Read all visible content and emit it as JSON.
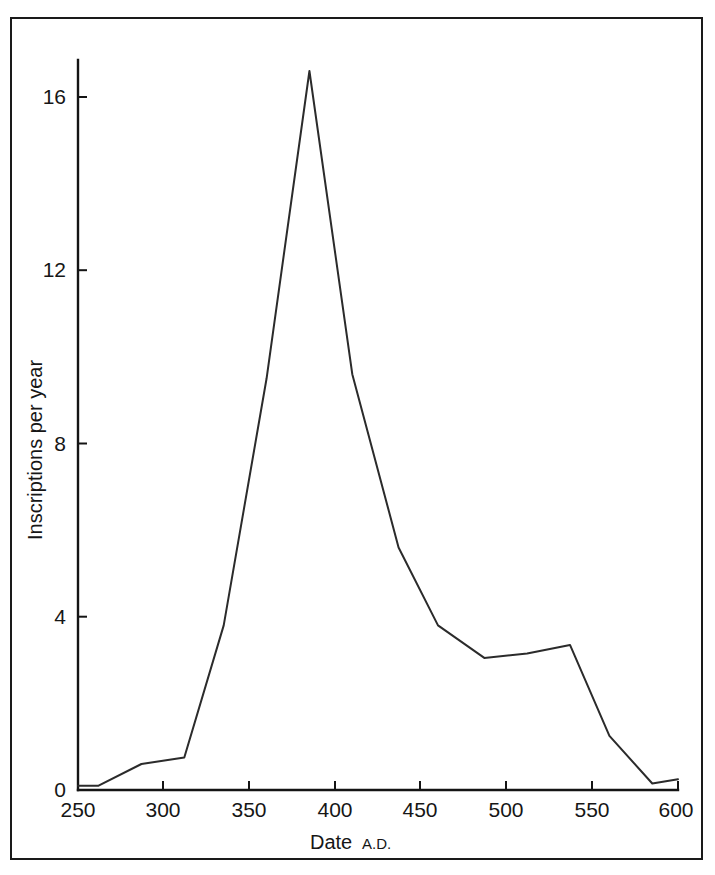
{
  "figure": {
    "background_color": "#ffffff",
    "frame_color": "#1a1a1a",
    "line_color": "#2b2b2b"
  },
  "axes": {
    "x_title_main": "Date",
    "x_title_suffix": "A.D.",
    "y_title": "Inscriptions per year",
    "x_tick_labels": [
      "250",
      "300",
      "350",
      "400",
      "450",
      "500",
      "550",
      "600"
    ],
    "y_tick_labels": [
      "0",
      "4",
      "8",
      "12",
      "16"
    ]
  },
  "chart_data": {
    "type": "line",
    "title": "",
    "xlabel": "Date A.D.",
    "ylabel": "Inscriptions per year",
    "xlim": [
      250,
      600
    ],
    "ylim": [
      0,
      17.4
    ],
    "xticks": [
      250,
      300,
      350,
      400,
      450,
      500,
      550,
      600
    ],
    "yticks": [
      0,
      4,
      8,
      12,
      16
    ],
    "grid": false,
    "legend": false,
    "x": [
      250,
      262,
      287,
      312,
      335,
      360,
      385,
      410,
      437,
      460,
      487,
      512,
      537,
      560,
      585,
      600
    ],
    "values": [
      0.1,
      0.1,
      0.6,
      0.75,
      3.8,
      9.5,
      16.6,
      9.6,
      5.6,
      3.8,
      3.05,
      3.15,
      3.35,
      1.25,
      0.15,
      0.25
    ],
    "series": [
      {
        "name": "Inscriptions per year",
        "points": [
          {
            "x": 250,
            "y": 0.1
          },
          {
            "x": 262,
            "y": 0.1
          },
          {
            "x": 287,
            "y": 0.6
          },
          {
            "x": 312,
            "y": 0.75
          },
          {
            "x": 335,
            "y": 3.8
          },
          {
            "x": 360,
            "y": 9.5
          },
          {
            "x": 385,
            "y": 16.6
          },
          {
            "x": 410,
            "y": 9.6
          },
          {
            "x": 437,
            "y": 5.6
          },
          {
            "x": 460,
            "y": 3.8
          },
          {
            "x": 487,
            "y": 3.05
          },
          {
            "x": 512,
            "y": 3.15
          },
          {
            "x": 537,
            "y": 3.35
          },
          {
            "x": 560,
            "y": 1.25
          },
          {
            "x": 585,
            "y": 0.15
          },
          {
            "x": 600,
            "y": 0.25
          }
        ]
      }
    ],
    "peak": {
      "x": 385,
      "y": 16.6
    }
  }
}
